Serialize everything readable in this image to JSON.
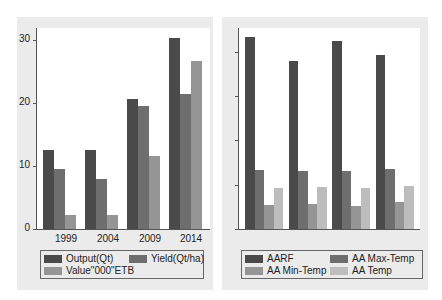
{
  "colors": {
    "series1": "#4a4a4a",
    "series2": "#6e6e6e",
    "series3": "#959595",
    "series4": "#bdbdbd",
    "panel": "#ebebeb"
  },
  "chart_data": [
    {
      "type": "bar",
      "title": "",
      "xlabel": "",
      "ylabel": "",
      "categories": [
        "1999",
        "2004",
        "2009",
        "2014"
      ],
      "series": [
        {
          "name": "Output(Qt)",
          "values": [
            12.5,
            12.5,
            20.7,
            30.3
          ]
        },
        {
          "name": "Yield(Qt/ha)",
          "values": [
            9.6,
            7.9,
            19.5,
            21.4
          ]
        },
        {
          "name": "Value\"000\"ETB",
          "values": [
            2.2,
            2.2,
            11.6,
            26.7
          ]
        }
      ],
      "yticks": [
        "0",
        "10",
        "20",
        "30"
      ],
      "ylim": [
        0,
        32
      ],
      "grid": false,
      "legend_position": "bottom"
    },
    {
      "type": "bar",
      "title": "",
      "xlabel": "",
      "ylabel": "",
      "categories": [
        "",
        "",
        "",
        ""
      ],
      "series": [
        {
          "name": "AARF",
          "values": [
            4.36,
            3.82,
            4.27,
            3.95
          ]
        },
        {
          "name": "AA Max-Temp",
          "values": [
            1.34,
            1.32,
            1.32,
            1.36
          ]
        },
        {
          "name": "AA Min-Temp",
          "values": [
            0.55,
            0.57,
            0.52,
            0.61
          ]
        },
        {
          "name": "AA Temp",
          "values": [
            0.93,
            0.95,
            0.93,
            0.98
          ]
        }
      ],
      "yticks_unlabeled": 4,
      "ylim": [
        0,
        4.6
      ],
      "grid": false,
      "legend_position": "bottom",
      "note": "y-axis ticks unlabeled; values in tick units"
    }
  ],
  "left": {
    "yticks": [
      "30",
      "20",
      "10",
      "0"
    ],
    "xlabels": [
      "1999",
      "2004",
      "2009",
      "2014"
    ],
    "legend": [
      "Output(Qt)",
      "Yield(Qt/ha)",
      "Value\"000\"ETB"
    ]
  },
  "right": {
    "legend": [
      "AARF",
      "AA Max-Temp",
      "AA Min-Temp",
      "AA Temp"
    ]
  }
}
